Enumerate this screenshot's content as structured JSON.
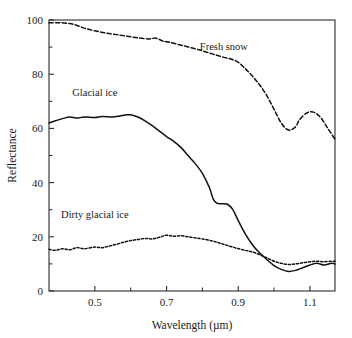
{
  "chart_data": {
    "type": "line",
    "title": "",
    "xlabel": "Wavelength (µm)",
    "ylabel": "Reflectance",
    "xlim": [
      0.372,
      1.17
    ],
    "ylim": [
      0,
      100
    ],
    "grid": false,
    "legend_position": "inline-annotations",
    "xticks": [
      0.5,
      0.7,
      0.9,
      1.1
    ],
    "xticklabels": [
      "0.5",
      "0.7",
      "0.9",
      "1.1"
    ],
    "xminorticks": [
      0.6,
      0.8,
      1.0
    ],
    "yticks": [
      0,
      20,
      40,
      60,
      80,
      100
    ],
    "yticklabels": [
      "0",
      "20",
      "40",
      "60",
      "80",
      "100"
    ],
    "yminorticks": [
      10,
      30,
      50,
      70,
      90
    ],
    "series": [
      {
        "name": "Fresh snow",
        "style": "dashed",
        "label_x": 0.86,
        "label_y": 89,
        "x": [
          0.372,
          0.4,
          0.43,
          0.45,
          0.47,
          0.5,
          0.53,
          0.56,
          0.59,
          0.62,
          0.65,
          0.67,
          0.69,
          0.7,
          0.72,
          0.75,
          0.78,
          0.8,
          0.83,
          0.86,
          0.88,
          0.9,
          0.92,
          0.94,
          0.96,
          0.98,
          1.0,
          1.02,
          1.04,
          1.06,
          1.07,
          1.09,
          1.11,
          1.13,
          1.15,
          1.17
        ],
        "y": [
          99.0,
          99.0,
          98.7,
          98.0,
          97.0,
          96.0,
          95.2,
          94.6,
          94.0,
          93.4,
          93.0,
          93.3,
          92.2,
          92.0,
          91.4,
          90.4,
          89.4,
          88.6,
          87.4,
          86.2,
          85.6,
          84.4,
          82.0,
          79.2,
          76.0,
          72.0,
          67.0,
          62.0,
          59.4,
          60.6,
          63.0,
          65.6,
          66.0,
          64.0,
          60.0,
          56.0
        ]
      },
      {
        "name": "Glacial ice",
        "style": "solid",
        "label_x": 0.5,
        "label_y": 72,
        "x": [
          0.372,
          0.39,
          0.41,
          0.43,
          0.45,
          0.47,
          0.5,
          0.52,
          0.55,
          0.57,
          0.59,
          0.6,
          0.62,
          0.64,
          0.66,
          0.68,
          0.7,
          0.72,
          0.74,
          0.76,
          0.78,
          0.8,
          0.82,
          0.83,
          0.84,
          0.855,
          0.87,
          0.885,
          0.9,
          0.92,
          0.94,
          0.96,
          0.98,
          1.0,
          1.02,
          1.04,
          1.06,
          1.08,
          1.1,
          1.12,
          1.14,
          1.16,
          1.17
        ],
        "y": [
          62.0,
          62.8,
          63.6,
          64.2,
          63.8,
          64.2,
          64.0,
          64.4,
          64.2,
          64.6,
          65.0,
          65.0,
          64.2,
          62.8,
          61.0,
          59.0,
          57.0,
          55.2,
          53.0,
          50.0,
          47.0,
          43.4,
          38.0,
          34.0,
          32.4,
          32.2,
          32.0,
          30.0,
          26.0,
          21.0,
          17.0,
          14.0,
          11.6,
          9.4,
          8.0,
          7.2,
          7.6,
          8.6,
          9.6,
          10.2,
          9.6,
          10.2,
          10.0
        ]
      },
      {
        "name": "Dirty glacial ice",
        "style": "dotted",
        "label_x": 0.5,
        "label_y": 27,
        "x": [
          0.372,
          0.39,
          0.41,
          0.43,
          0.45,
          0.47,
          0.5,
          0.52,
          0.54,
          0.56,
          0.58,
          0.6,
          0.62,
          0.64,
          0.66,
          0.68,
          0.7,
          0.72,
          0.74,
          0.76,
          0.78,
          0.8,
          0.83,
          0.86,
          0.89,
          0.92,
          0.94,
          0.96,
          0.98,
          1.0,
          1.02,
          1.04,
          1.06,
          1.08,
          1.1,
          1.12,
          1.14,
          1.16,
          1.17
        ],
        "y": [
          15.4,
          15.0,
          15.6,
          15.2,
          16.0,
          15.6,
          16.2,
          16.0,
          16.6,
          17.2,
          18.0,
          18.6,
          19.0,
          19.4,
          19.2,
          19.8,
          20.6,
          20.2,
          20.4,
          20.0,
          19.6,
          19.2,
          18.4,
          17.2,
          16.0,
          15.0,
          14.4,
          13.4,
          12.2,
          11.0,
          10.2,
          9.8,
          10.0,
          10.4,
          10.8,
          11.0,
          10.8,
          11.0,
          11.0
        ]
      }
    ]
  },
  "axes": {
    "x_title": "Wavelength (µm)",
    "y_title": "Reflectance"
  }
}
